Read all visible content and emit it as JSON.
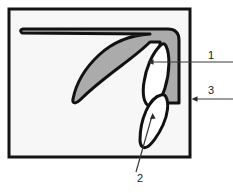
{
  "figure": {
    "type": "technical-line-drawing",
    "background_color": "#ffffff",
    "frame": {
      "name": "frame-border",
      "stroke_color": "#141414",
      "fill_color": "#f7f7f7",
      "stroke_width": 3,
      "x": 9,
      "y": 9,
      "width": 181,
      "height": 148
    },
    "shapes": [
      {
        "id": "gray-body",
        "label": "tapered-hook-body",
        "fill_color": "#ababab",
        "stroke_color": "#111111",
        "stroke_width": 3
      },
      {
        "id": "upper-lens",
        "label": "upper-white-lens",
        "fill_color": "#ffffff",
        "stroke_color": "#111111",
        "stroke_width": 3
      },
      {
        "id": "lower-lens",
        "label": "lower-white-lens",
        "fill_color": "#ffffff",
        "stroke_color": "#111111",
        "stroke_width": 3
      }
    ],
    "callouts": [
      {
        "id": "callout-1",
        "label": "1",
        "label_x": 211,
        "label_y": 59,
        "leader": "horizontal arrow pointing left into upper white lens",
        "arrow_tip_x": 148,
        "arrow_tip_y": 62,
        "line_start_x": 233,
        "line_start_y": 62
      },
      {
        "id": "callout-2",
        "label": "2",
        "label_x": 140,
        "label_y": 182,
        "leader": "diagonal arrow pointing up into lower white lens",
        "arrow_tip_x": 152,
        "arrow_tip_y": 114,
        "line_start_x": 136,
        "line_start_y": 172
      },
      {
        "id": "callout-3",
        "label": "3",
        "label_x": 211,
        "label_y": 94,
        "leader": "horizontal arrow pointing left at frame right edge",
        "arrow_tip_x": 192,
        "arrow_tip_y": 99,
        "line_start_x": 233,
        "line_start_y": 99
      }
    ],
    "leader_stroke_color": "#3a3a3a",
    "leader_stroke_width": 1.2
  }
}
